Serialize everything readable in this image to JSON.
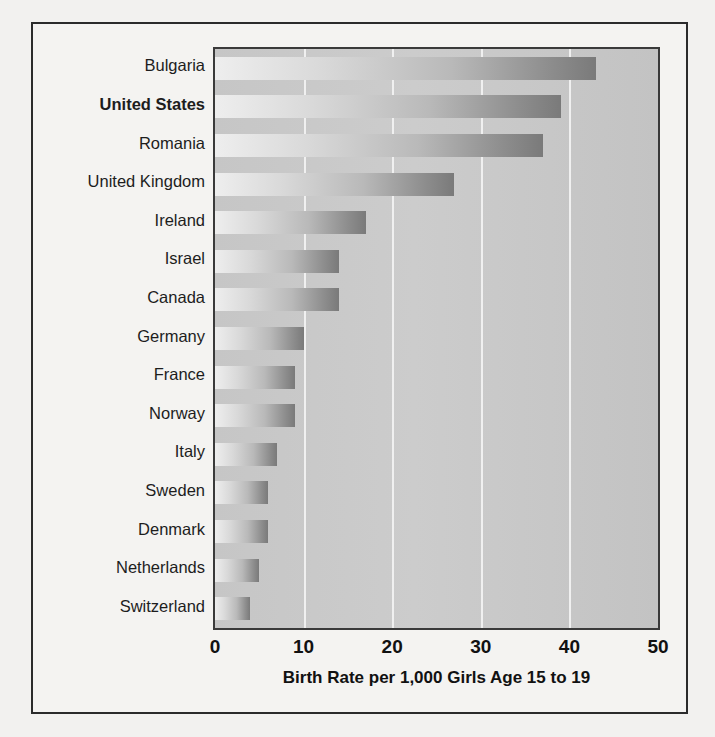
{
  "figure": {
    "axis_title": "Birth Rate per 1,000 Girls Age 15 to 19",
    "highlight_category": "United States",
    "frame_color": "#2b2b2b",
    "panel_color": "#c9c9c9",
    "gridline_color": "#f0f0f0",
    "bar_gradient_start": "#eeeeee",
    "bar_gradient_end": "#7a7a7a"
  },
  "chart_data": {
    "type": "bar",
    "orientation": "horizontal",
    "title": "",
    "subtitle": "",
    "xlabel": "Birth Rate per 1,000 Girls Age 15 to 19",
    "ylabel": "",
    "xlim": [
      0,
      50
    ],
    "xticks": [
      0,
      10,
      20,
      30,
      40,
      50
    ],
    "xtick_labels": [
      "0",
      "10",
      "20",
      "30",
      "40",
      "50"
    ],
    "grid": true,
    "grid_axis": "x",
    "legend": false,
    "categories": [
      "Bulgaria",
      "United States",
      "Romania",
      "United Kingdom",
      "Ireland",
      "Israel",
      "Canada",
      "Germany",
      "France",
      "Norway",
      "Italy",
      "Sweden",
      "Denmark",
      "Netherlands",
      "Switzerland"
    ],
    "values": [
      43,
      39,
      37,
      27,
      17,
      14,
      14,
      10,
      9,
      9,
      7,
      6,
      6,
      5,
      4
    ]
  },
  "ghost_text": {
    "lines": [
      "scanned page bleed-through",
      "of the facing page text",
      "rendered very faintly"
    ]
  }
}
